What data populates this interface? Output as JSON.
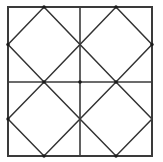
{
  "figure": {
    "type": "geometric-line-drawing",
    "canvas": {
      "width": 163,
      "height": 162,
      "background_color": "#ffffff"
    },
    "outer_square": {
      "name": "outer-square-border",
      "left": 8,
      "top": 7,
      "right": 152,
      "bottom": 156,
      "stroke_color": "#3a3a3a",
      "stroke_width": 2
    },
    "divider_lines": [
      {
        "name": "vertical-midline",
        "orientation": "vertical",
        "x1": 80,
        "y1": 7,
        "x2": 80,
        "y2": 156,
        "stroke_color": "#3a3a3a",
        "stroke_width": 1.6
      },
      {
        "name": "horizontal-midline",
        "orientation": "horizontal",
        "x1": 8,
        "y1": 82,
        "x2": 152,
        "y2": 82,
        "stroke_color": "#3a3a3a",
        "stroke_width": 1.6
      }
    ],
    "quadrants": [
      {
        "name": "quadrant-top-left",
        "bounds": {
          "left": 8,
          "top": 7,
          "right": 80,
          "bottom": 82
        },
        "diamond": {
          "name": "diamond-top-left",
          "points": "44,7 80,44.5 44,82 8,44.5",
          "stroke_color": "#333333",
          "stroke_width": 1.5,
          "fill": "none"
        }
      },
      {
        "name": "quadrant-top-right",
        "bounds": {
          "left": 80,
          "top": 7,
          "right": 152,
          "bottom": 82
        },
        "diamond": {
          "name": "diamond-top-right",
          "points": "116,7 152,44.5 116,82 80,44.5",
          "stroke_color": "#333333",
          "stroke_width": 1.5,
          "fill": "none"
        }
      },
      {
        "name": "quadrant-bottom-left",
        "bounds": {
          "left": 8,
          "top": 82,
          "right": 80,
          "bottom": 156
        },
        "diamond": {
          "name": "diamond-bottom-left",
          "points": "44,82 80,119 44,156 8,119",
          "stroke_color": "#333333",
          "stroke_width": 1.5,
          "fill": "none"
        }
      },
      {
        "name": "quadrant-bottom-right",
        "bounds": {
          "left": 80,
          "top": 82,
          "right": 152,
          "bottom": 156
        },
        "diamond": {
          "name": "diamond-bottom-right",
          "points": "116,82 152,119 116,156 80,119",
          "stroke_color": "#333333",
          "stroke_width": 1.5,
          "fill": "none"
        }
      }
    ],
    "vertex_dots": [
      {
        "name": "vertex-dot-top-left-quadrant-apex",
        "cx": 44,
        "cy": 7
      },
      {
        "name": "vertex-dot-top-right-quadrant-apex",
        "cx": 116,
        "cy": 7
      },
      {
        "name": "vertex-dot-center",
        "cx": 80,
        "cy": 82
      },
      {
        "name": "vertex-dot-left-midpoint-upper",
        "cx": 8,
        "cy": 44.5
      },
      {
        "name": "vertex-dot-left-midpoint-lower",
        "cx": 8,
        "cy": 119
      },
      {
        "name": "vertex-dot-right-midpoint-upper",
        "cx": 152,
        "cy": 44.5
      },
      {
        "name": "vertex-dot-bottom-left-quadrant-apex",
        "cx": 44,
        "cy": 156
      },
      {
        "name": "vertex-dot-bottom-right-quadrant-apex",
        "cx": 116,
        "cy": 156
      },
      {
        "name": "vertex-dot-quadrant-join-left",
        "cx": 44,
        "cy": 82
      },
      {
        "name": "vertex-dot-quadrant-join-right",
        "cx": 116,
        "cy": 82
      },
      {
        "name": "vertex-dot-dot-color",
        "cx": -10,
        "cy": -10
      }
    ],
    "vertex_dot_color": "#1a1a1a",
    "vertex_dot_radius": 1.7
  }
}
